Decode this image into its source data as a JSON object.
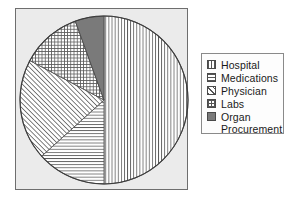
{
  "chart_data": {
    "type": "pie",
    "title": "",
    "categories": [
      "Hospital",
      "Medications",
      "Physician",
      "Labs",
      "Organ Procurement"
    ],
    "values": [
      50,
      13,
      19,
      12,
      6
    ],
    "units": "percent",
    "start_angle_deg": 0,
    "direction": "clockwise",
    "legend_position": "right",
    "grid": false,
    "slices": [
      {
        "label": "Hospital",
        "value": 50,
        "start_deg": 0,
        "end_deg": 180,
        "pattern": "vertical-lines",
        "fill": "#ffffff",
        "line_color": "#555555"
      },
      {
        "label": "Medications",
        "value": 13,
        "start_deg": 180,
        "end_deg": 228,
        "pattern": "horizontal-lines",
        "fill": "#ffffff",
        "line_color": "#555555"
      },
      {
        "label": "Physician",
        "value": 19,
        "start_deg": 228,
        "end_deg": 298,
        "pattern": "diagonal-lines",
        "fill": "#ffffff",
        "line_color": "#555555"
      },
      {
        "label": "Labs",
        "value": 12,
        "start_deg": 298,
        "end_deg": 340,
        "pattern": "cross-hatch",
        "fill": "#ffffff",
        "line_color": "#555555"
      },
      {
        "label": "Organ Procurement",
        "value": 6,
        "start_deg": 340,
        "end_deg": 360,
        "pattern": "solid",
        "fill": "#7a7a7a",
        "line_color": "#4a4a4a"
      }
    ]
  },
  "plot": {
    "background_color": "#ebebeb",
    "border_color": "#6e6e6e",
    "pie_outline_color": "#3c3c3c"
  },
  "legend": {
    "background_color": "#fdfdfd",
    "border_color": "#8a8a8a",
    "items": [
      {
        "label": "Hospital",
        "swatch": "vertical-lines-swatch"
      },
      {
        "label": "Medications",
        "swatch": "horizontal-lines-swatch"
      },
      {
        "label": "Physician",
        "swatch": "diagonal-lines-swatch"
      },
      {
        "label": "Labs",
        "swatch": "cross-hatch-swatch"
      },
      {
        "label": "Organ",
        "swatch": "solid-gray-swatch"
      }
    ],
    "organ_continuation": "Procurement"
  }
}
